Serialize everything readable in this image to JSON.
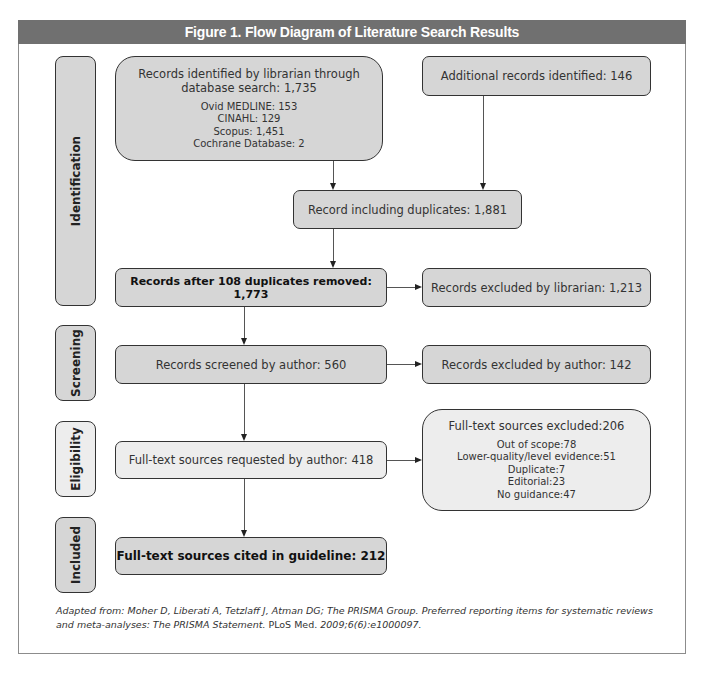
{
  "figure": {
    "title": "Figure 1.  Flow Diagram of Literature Search Results"
  },
  "stages": {
    "identification": "Identification",
    "screening": "Screening",
    "eligibility": "Eligibility",
    "included": "Included"
  },
  "boxes": {
    "librarian_search": {
      "heading_line1": "Records identified by librarian through",
      "heading_line2": "database search: 1,735",
      "sources": [
        "Ovid MEDLINE: 153",
        "CINAHL: 129",
        "Scopus: 1,451",
        "Cochrane Database: 2"
      ]
    },
    "additional_records": "Additional records identified: 146",
    "including_duplicates": "Record including duplicates: 1,881",
    "after_duplicates_removed": "Records after 108 duplicates removed: 1,773",
    "excluded_by_librarian": "Records excluded by librarian: 1,213",
    "screened_by_author": "Records screened by author: 560",
    "excluded_by_author": "Records excluded by author: 142",
    "fulltext_requested": "Full-text sources requested by author: 418",
    "fulltext_excluded": {
      "heading": "Full-text sources excluded:206",
      "reasons": [
        "Out of scope:78",
        "Lower-quality/level evidence:51",
        "Duplicate:7",
        "Editorial:23",
        "No guidance:47"
      ]
    },
    "fulltext_cited": "Full-text sources cited in guideline: 212"
  },
  "caption": {
    "italic_part": "Adapted from: Moher D, Liberati A, Tetzlaff J, Atman DG; The PRISMA Group. Preferred reporting items for systematic reviews and meta-analyses: The PRISMA Statement.",
    "plain_part": " PLoS Med.",
    "italic_tail": " 2009;6(6):e1000097."
  },
  "colors": {
    "title_bar": "#707070",
    "box_fill": "#d6d6d6",
    "box_fill_light": "#ededed",
    "border": "#333333"
  }
}
